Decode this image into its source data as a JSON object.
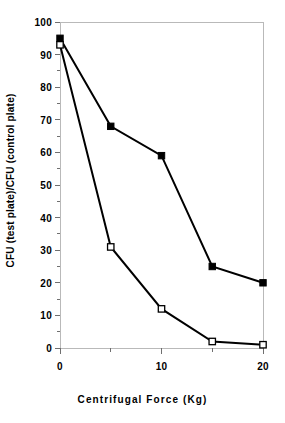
{
  "chart_data": {
    "type": "line",
    "title": "",
    "xlabel": "Centrifugal Force (Kg)",
    "ylabel": "CFU (test plate)/CFU (control plate)",
    "x": [
      0,
      5,
      10,
      15,
      20
    ],
    "xlim": [
      0,
      20
    ],
    "ylim": [
      0,
      100
    ],
    "xticks": [
      0,
      10,
      20
    ],
    "xtick_labels": [
      "0",
      "10",
      "20"
    ],
    "xminor_ticks": [
      5,
      15
    ],
    "yticks": [
      0,
      10,
      20,
      30,
      40,
      50,
      60,
      70,
      80,
      90,
      100
    ],
    "ytick_labels": [
      "0",
      "10",
      "20",
      "30",
      "40",
      "50",
      "60",
      "70",
      "80",
      "90",
      "100"
    ],
    "yminor_ticks": [
      5,
      15,
      25,
      35,
      45,
      55,
      65,
      75,
      85,
      95
    ],
    "grid": false,
    "legend": "none",
    "series": [
      {
        "name": "filled-square-series",
        "marker": "filled-square",
        "marker_color": "#000000",
        "line_color": "#000000",
        "values": [
          95,
          68,
          59,
          25,
          20
        ]
      },
      {
        "name": "open-square-series",
        "marker": "open-square",
        "marker_color": "#ffffff",
        "marker_edge_color": "#000000",
        "line_color": "#000000",
        "values": [
          93,
          31,
          12,
          2,
          1
        ]
      }
    ]
  },
  "figure": {
    "background": "#ffffff",
    "frame_color": "#b9b9b9",
    "tick_color": "#6f6f6f",
    "text_color": "#000000"
  }
}
